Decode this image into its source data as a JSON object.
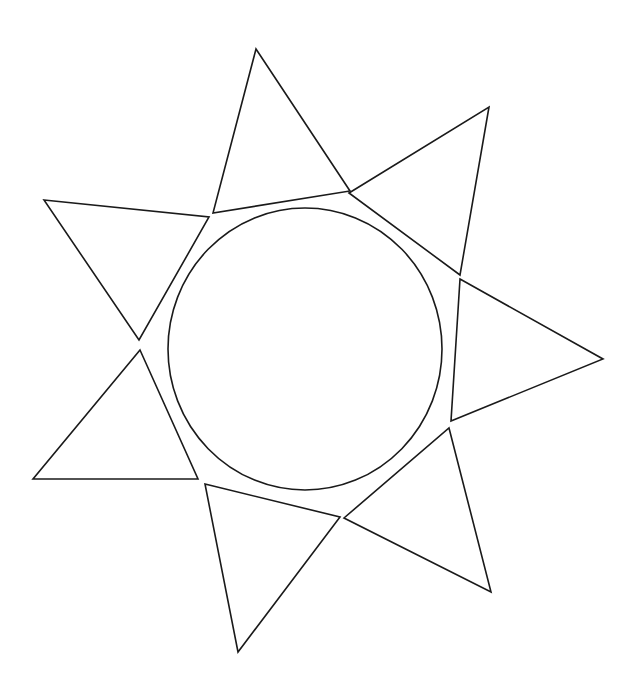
{
  "drawing": {
    "title": "Sun line drawing",
    "width": 643,
    "height": 695,
    "background": "#ffffff",
    "stroke_color": "#1a1a1a",
    "stroke_width": 1.6,
    "center_circle": {
      "cx": 305,
      "cy": 349,
      "rx": 137,
      "ry": 141
    },
    "rays": [
      {
        "name": "ray-top",
        "points": [
          [
            256,
            49
          ],
          [
            350,
            191
          ],
          [
            213,
            213
          ]
        ]
      },
      {
        "name": "ray-upper-right",
        "points": [
          [
            349,
            193
          ],
          [
            489,
            107
          ],
          [
            460,
            275
          ]
        ]
      },
      {
        "name": "ray-right",
        "points": [
          [
            460,
            279
          ],
          [
            603,
            359
          ],
          [
            451,
            421
          ]
        ]
      },
      {
        "name": "ray-lower-right",
        "points": [
          [
            449,
            428
          ],
          [
            491,
            592
          ],
          [
            344,
            518
          ]
        ]
      },
      {
        "name": "ray-bottom",
        "points": [
          [
            205,
            484
          ],
          [
            340,
            517
          ],
          [
            238,
            652
          ]
        ]
      },
      {
        "name": "ray-lower-left",
        "points": [
          [
            140,
            350
          ],
          [
            198,
            479
          ],
          [
            33,
            479
          ]
        ]
      },
      {
        "name": "ray-upper-left",
        "points": [
          [
            44,
            200
          ],
          [
            209,
            217
          ],
          [
            139,
            340
          ]
        ]
      }
    ]
  }
}
